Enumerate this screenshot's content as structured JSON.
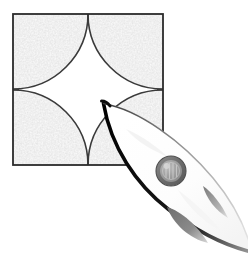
{
  "canvas": {
    "width": 248,
    "height": 270,
    "background_color": "#ffffff",
    "title": "Textured quartered square with rocket overlay"
  },
  "palette": {
    "background": "#ffffff",
    "square_stroke": "#2b2b2b",
    "texture_base": "#e6e6e6",
    "texture_speckle": "#fafafa",
    "arc_stroke": "#3a3a3a",
    "rocket_body": "#ffffff",
    "rocket_outline_dark": "#0d0d0d",
    "rocket_outline_light": "#8a8a8a",
    "porthole_ring": "#6e6e6e",
    "porthole_glass": "#9a9a9a",
    "porthole_highlight": "#c8c8c8",
    "fin_fill": "#7d7d7d"
  },
  "square": {
    "label": "quartered-textured-square",
    "x": 12,
    "y": 13,
    "width": 152,
    "height": 153,
    "stroke_width": 2,
    "divider_x": 88,
    "divider_y": 89,
    "quadrants": [
      {
        "name": "top-left",
        "arc_center": "top-left",
        "fill": "textured"
      },
      {
        "name": "top-right",
        "arc_center": "top-right",
        "fill": "textured"
      },
      {
        "name": "bottom-left",
        "arc_center": "bottom-left",
        "fill": "textured"
      },
      {
        "name": "bottom-right",
        "arc_center": "bottom-right",
        "fill": "textured"
      }
    ],
    "center_shape": "white four-pointed star (astroid) formed by four quarter-circle cutouts"
  },
  "rocket": {
    "label": "rocket-ship",
    "orientation_degrees": 42,
    "nose_point": {
      "x": 103,
      "y": 103
    },
    "tail_point": {
      "x": 248,
      "y": 268
    },
    "body_fill": "#ffffff",
    "outline_dark_side": "lower-left",
    "outline_light_side": "upper-right",
    "porthole": {
      "label": "porthole-window",
      "center_x": 171,
      "center_y": 171,
      "outer_radius": 15,
      "inner_radius": 11
    },
    "fins": [
      {
        "name": "fin-lower",
        "center_x": 186,
        "center_y": 222,
        "length": 44,
        "width": 16,
        "angle": 40
      },
      {
        "name": "fin-upper",
        "center_x": 215,
        "center_y": 198,
        "length": 34,
        "width": 10,
        "angle": 52
      }
    ],
    "highlights": [
      {
        "name": "nose-streak",
        "x": 140,
        "y": 142
      },
      {
        "name": "body-sheen",
        "x": 190,
        "y": 205
      }
    ]
  }
}
